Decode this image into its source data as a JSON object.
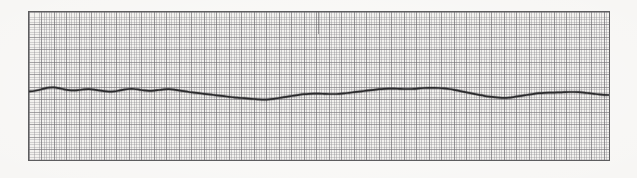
{
  "document": {
    "kind": "ecg-rhythm-strip",
    "background_color": "#f7f6f4"
  },
  "frame": {
    "border_color": "#5d5d5f",
    "fill_color": "#f3f2ef",
    "x": 28,
    "y": 11,
    "width": 582,
    "height": 150
  },
  "grid": {
    "fine_spacing_px": 2.5,
    "major_spacing_px": 12.5,
    "fine_color": "#8e8c91",
    "major_color": "#6e6c70",
    "visible": true
  },
  "markers": {
    "calibration_tick": {
      "label": "",
      "x": 289,
      "y": 0,
      "height": 22,
      "color": "#565458"
    }
  },
  "trace": {
    "color": "#2b2b2d",
    "stroke_width": 1.7,
    "baseline_y": 78
  },
  "chart_data": {
    "type": "line",
    "title": "",
    "subtitle": "",
    "xlabel": "",
    "ylabel": "",
    "xlim": [
      0,
      582
    ],
    "ylim": [
      0,
      150
    ],
    "grid": true,
    "legend": null,
    "axis_ticks_visible": false,
    "series": [
      {
        "name": "ecg-trace",
        "color": "#2b2b2d",
        "x": [
          0,
          5,
          10,
          15,
          20,
          25,
          30,
          35,
          40,
          45,
          50,
          55,
          60,
          65,
          70,
          75,
          80,
          85,
          90,
          95,
          100,
          105,
          110,
          115,
          120,
          125,
          130,
          135,
          140,
          145,
          150,
          155,
          160,
          165,
          170,
          175,
          180,
          185,
          190,
          195,
          200,
          205,
          210,
          215,
          220,
          225,
          230,
          235,
          240,
          245,
          250,
          255,
          260,
          265,
          270,
          275,
          280,
          285,
          290,
          295,
          300,
          305,
          310,
          315,
          320,
          325,
          330,
          335,
          340,
          345,
          350,
          355,
          360,
          365,
          370,
          375,
          380,
          385,
          390,
          395,
          400,
          405,
          410,
          415,
          420,
          425,
          430,
          435,
          440,
          445,
          450,
          455,
          460,
          465,
          470,
          475,
          480,
          485,
          490,
          495,
          500,
          505,
          510,
          515,
          520,
          525,
          530,
          535,
          540,
          545,
          550,
          555,
          560,
          565,
          570,
          575,
          580,
          582
        ],
        "y": [
          79.5,
          79.0,
          78.0,
          76.6,
          75.6,
          75.4,
          76.2,
          77.4,
          78.2,
          78.4,
          78.0,
          77.4,
          77.2,
          77.6,
          78.4,
          79.2,
          79.6,
          79.4,
          78.6,
          77.6,
          77.0,
          77.0,
          77.6,
          78.4,
          78.8,
          78.6,
          78.0,
          77.4,
          77.2,
          77.6,
          78.4,
          79.2,
          80.0,
          80.6,
          81.2,
          81.8,
          82.4,
          83.0,
          83.6,
          84.2,
          84.8,
          85.4,
          85.8,
          86.2,
          86.6,
          87.0,
          87.4,
          87.6,
          87.4,
          86.8,
          86.0,
          85.2,
          84.4,
          83.6,
          82.8,
          82.2,
          81.8,
          81.6,
          81.6,
          81.8,
          82.0,
          82.0,
          81.8,
          81.4,
          80.8,
          80.2,
          79.6,
          79.0,
          78.4,
          77.8,
          77.2,
          76.8,
          76.6,
          76.6,
          76.8,
          77.0,
          77.0,
          76.8,
          76.4,
          76.0,
          75.8,
          75.8,
          76.0,
          76.4,
          77.0,
          77.8,
          78.8,
          79.8,
          80.8,
          81.8,
          82.8,
          83.8,
          84.6,
          85.2,
          85.6,
          85.8,
          85.6,
          85.0,
          84.2,
          83.4,
          82.6,
          81.8,
          81.2,
          80.8,
          80.6,
          80.6,
          80.4,
          80.2,
          80.0,
          80.0,
          80.2,
          80.6,
          81.2,
          81.8,
          82.4,
          82.8,
          83.0,
          83.0
        ]
      }
    ]
  }
}
